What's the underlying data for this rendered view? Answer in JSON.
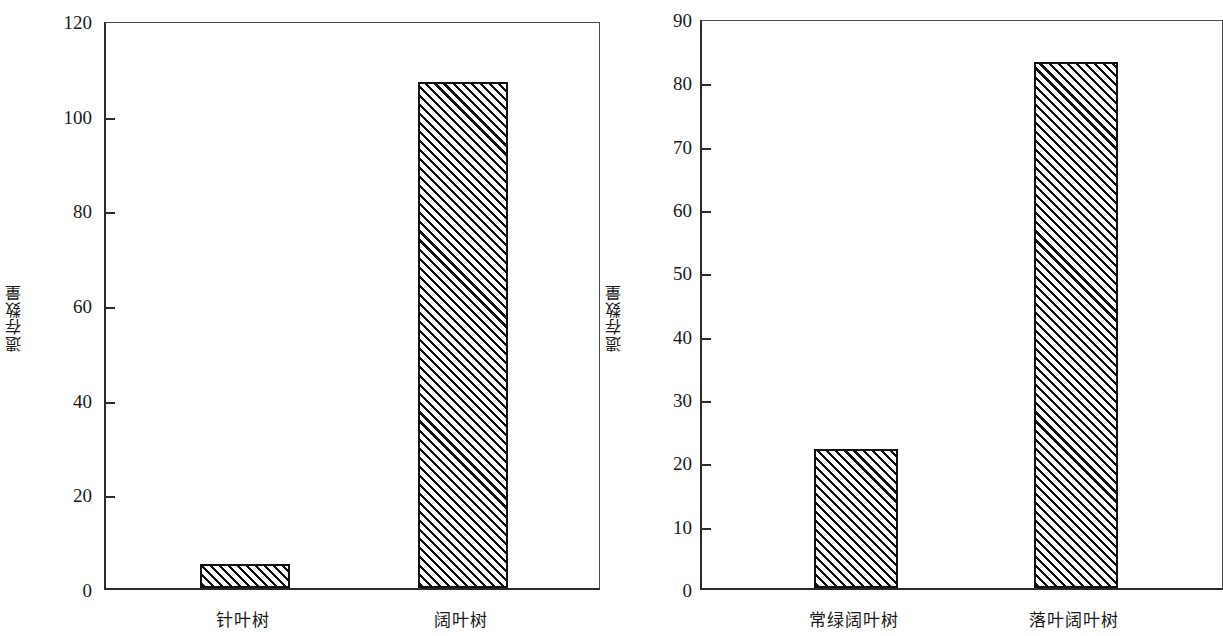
{
  "figure": {
    "background_color": "#ffffff",
    "axis_color": "#2b2b2b",
    "bar_edge_color": "#111111",
    "bar_fill_color": "#ffffff",
    "bar_hatch": "diagonal-forward-slash"
  },
  "chart_data": [
    {
      "type": "bar",
      "title": "",
      "xlabel": "",
      "ylabel": "遗存数量",
      "categories": [
        "针叶树",
        "阔叶树"
      ],
      "values": [
        5,
        107
      ],
      "ylim": [
        0,
        120
      ],
      "yticks": [
        0,
        20,
        40,
        60,
        80,
        100,
        120
      ],
      "ytick_labels": [
        "0",
        "20",
        "40",
        "60",
        "80",
        "100",
        "120"
      ],
      "grid": false,
      "legend": false
    },
    {
      "type": "bar",
      "title": "",
      "xlabel": "",
      "ylabel": "遗存数量",
      "categories": [
        "常绿阔叶树",
        "落叶阔叶树"
      ],
      "values": [
        22,
        83
      ],
      "ylim": [
        0,
        90
      ],
      "yticks": [
        0,
        10,
        20,
        30,
        40,
        50,
        60,
        70,
        80,
        90
      ],
      "ytick_labels": [
        "0",
        "10",
        "20",
        "30",
        "40",
        "50",
        "60",
        "70",
        "80",
        "90"
      ],
      "grid": false,
      "legend": false
    }
  ]
}
